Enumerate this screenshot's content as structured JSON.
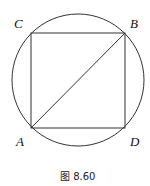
{
  "figure": {
    "caption": "图 8.60",
    "labels": {
      "C": "C",
      "B": "B",
      "A": "A",
      "D": "D"
    },
    "stroke_color": "#333333"
  }
}
